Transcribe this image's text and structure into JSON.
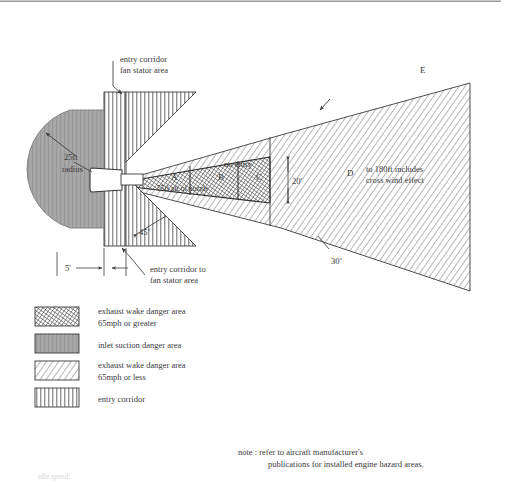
{
  "diagram": {
    "top_border": true,
    "annotations": {
      "entry_corridor_top_l1": "entry corridor",
      "entry_corridor_top_l2": "fan stator area",
      "radius_l1": "25ft",
      "radius_l2": "radius",
      "angle_45": "45˚",
      "angle_30": "30˚",
      "dim_5ft": "5'",
      "dim_20ft": "20'",
      "entry_corridor_bottom_l1": "entry corridor to",
      "entry_corridor_bottom_l2": "fan stator area",
      "no_entry": "no entry",
      "zone_a": "A",
      "zone_b": "B",
      "zone_c": "C",
      "zone_d": "D",
      "zone_e": "E",
      "aft_of_nozzle": "55ft aft of nozzle",
      "wind_l1": "to 180ft includes",
      "wind_l2": "cross wind effect",
      "idle_speed": "idle speed:"
    },
    "note": {
      "line1": "note : refer to aircraft manufacturer's",
      "line2": "publications for installed engine hazard areas."
    },
    "legend": [
      {
        "swatch": "crosshatch",
        "line1": "exhaust wake danger area",
        "line2": "65mph or greater"
      },
      {
        "swatch": "solid-gray-vertical",
        "line1": "inlet suction danger area",
        "line2": ""
      },
      {
        "swatch": "diagonal",
        "line1": "exhaust wake danger area",
        "line2": "65mph or less"
      },
      {
        "swatch": "vertical",
        "line1": "entry corridor",
        "line2": ""
      }
    ],
    "colors": {
      "ink": "#3a3a3a",
      "inlet_gray": "#a8a8a8",
      "hatch": "#555555",
      "background": "#ffffff"
    }
  }
}
